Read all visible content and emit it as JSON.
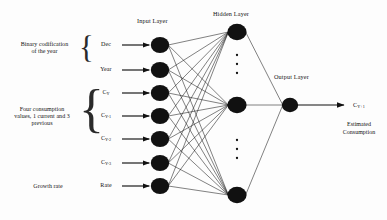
{
  "figure": {
    "width": 387,
    "height": 220,
    "background": "#fdfdfd",
    "ink": "#111111"
  },
  "layers": {
    "input_title": "Input Layer",
    "hidden_title": "Hidden Layer",
    "output_title": "Output Layer"
  },
  "input_nodes": [
    {
      "label": "Dec",
      "sub": "",
      "y": 45
    },
    {
      "label": "Year",
      "sub": "",
      "y": 70
    },
    {
      "label": "C",
      "sub": "Y",
      "y": 93
    },
    {
      "label": "C",
      "sub": "Y-1",
      "y": 116
    },
    {
      "label": "C",
      "sub": "Y-2",
      "y": 139
    },
    {
      "label": "C",
      "sub": "Y-3",
      "y": 163
    },
    {
      "label": "Rate",
      "sub": "",
      "y": 186
    }
  ],
  "groups": [
    {
      "name": "binary-codification",
      "text": "Binary codification\nof the year"
    },
    {
      "name": "four-consumption",
      "text": "Four consumption\nvalues, 1 current and 3\nprevious"
    },
    {
      "name": "growth-rate",
      "text": "Growth rate"
    }
  ],
  "hidden_nodes": [
    {
      "y": 32
    },
    {
      "y": 105
    },
    {
      "y": 195
    }
  ],
  "hidden_ellipses": [
    {
      "y_start": 55,
      "count": 3
    },
    {
      "y_start": 140,
      "count": 3
    }
  ],
  "output_node": {
    "x": 290,
    "y": 105
  },
  "output": {
    "symbol": "C",
    "symbol_sub": "Y+1",
    "caption": "Estimated\nConsumption"
  },
  "chart_data": {
    "type": "diagram",
    "diagram_kind": "feedforward-neural-network",
    "title": "",
    "layer_sizes": {
      "input": 7,
      "hidden": "variable (3 shown + ellipses)",
      "output": 1
    },
    "input_labels": [
      "Dec",
      "Year",
      "C_Y",
      "C_Y-1",
      "C_Y-2",
      "C_Y-3",
      "Rate"
    ],
    "input_groups": [
      {
        "label": "Binary codification of the year",
        "members": [
          "Dec",
          "Year"
        ]
      },
      {
        "label": "Four consumption values, 1 current and 3 previous",
        "members": [
          "C_Y",
          "C_Y-1",
          "C_Y-2",
          "C_Y-3"
        ]
      },
      {
        "label": "Growth rate",
        "members": [
          "Rate"
        ]
      }
    ],
    "output_label": "C_Y+1",
    "output_description": "Estimated Consumption",
    "connectivity": "fully-connected",
    "node_color": "#111111",
    "edge_color": "#1a1a1a"
  }
}
